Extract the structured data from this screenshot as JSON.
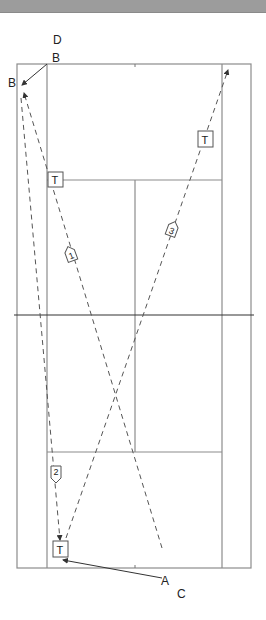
{
  "diagram": {
    "type": "badminton-court-movement",
    "labels": {
      "D": "D",
      "B_top": "B",
      "B_left": "B",
      "A": "A",
      "C": "C"
    },
    "markers": [
      {
        "id": "T1",
        "text": "T",
        "x": 55,
        "y": 181
      },
      {
        "id": "T2",
        "text": "T",
        "x": 205,
        "y": 140
      },
      {
        "id": "T3",
        "text": "T",
        "x": 62,
        "y": 549
      }
    ],
    "paths": [
      {
        "id": "1",
        "label": "1"
      },
      {
        "id": "2",
        "label": "2"
      },
      {
        "id": "3",
        "label": "3"
      }
    ]
  }
}
